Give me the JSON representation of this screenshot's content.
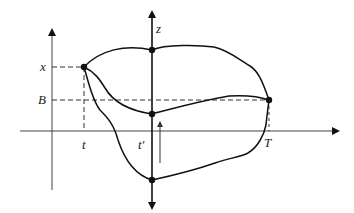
{
  "diagram": {
    "labels": {
      "x_level": "x",
      "b_level": "B",
      "z_axis": "z",
      "t_tick": "t",
      "t_prime_tick": "t′",
      "T_tick": "T"
    },
    "colors": {
      "stroke": "#111111",
      "axis": "#444444",
      "dashed": "#333333",
      "background": "#ffffff"
    },
    "points": [
      {
        "name": "start-point-x",
        "x": 84,
        "y": 67
      },
      {
        "name": "z-axis-top-point",
        "x": 152,
        "y": 50
      },
      {
        "name": "z-axis-middle-point",
        "x": 152,
        "y": 114
      },
      {
        "name": "z-axis-bottom-point",
        "x": 152,
        "y": 180
      },
      {
        "name": "end-point-T",
        "x": 269,
        "y": 100
      }
    ]
  }
}
